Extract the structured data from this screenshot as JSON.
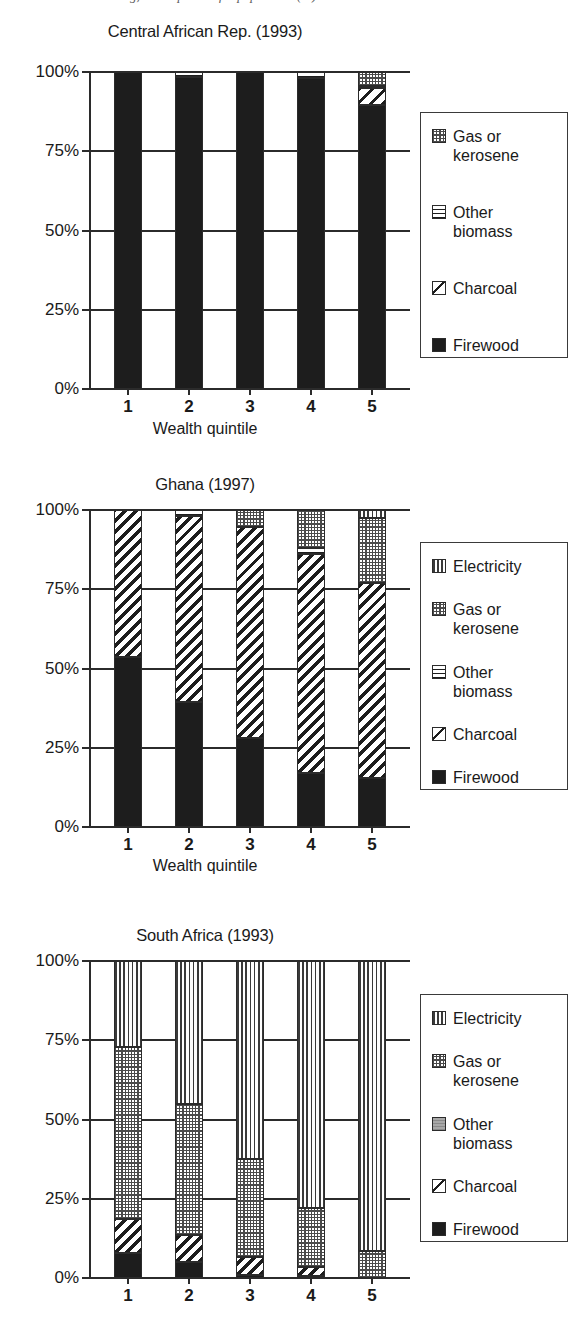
{
  "page": {
    "cut_header_text": "ing, and expanded for population (%)"
  },
  "axis": {
    "y_ticks": [
      "100%",
      "75%",
      "50%",
      "25%",
      "0%"
    ],
    "y_tick_values": [
      100,
      75,
      50,
      25,
      0
    ],
    "x_ticks": [
      "1",
      "2",
      "3",
      "4",
      "5"
    ],
    "x_axis_label": "Wealth quintile"
  },
  "fuels": {
    "firewood": {
      "label": "Firewood",
      "pattern": "solid-black",
      "color": "#1d1d1d"
    },
    "charcoal": {
      "label": "Charcoal",
      "pattern": "diagonal-hatch",
      "color": "#ffffff"
    },
    "other_biomass": {
      "label": "Other\nbiomass",
      "pattern": "horizontal-lines",
      "color": "#ffffff"
    },
    "gas_or_kerosene": {
      "label": "Gas or\nkerosene",
      "pattern": "crosshatch-grid",
      "color": "#cccccc"
    },
    "electricity": {
      "label": "Electricity",
      "pattern": "vertical-lines",
      "color": "#ffffff"
    }
  },
  "charts": [
    {
      "id": "central-african-rep",
      "title": "Central African Rep. (1993)",
      "show_x_axis_label": true,
      "legend": [
        "gas_or_kerosene",
        "other_biomass",
        "charcoal",
        "firewood"
      ],
      "chart_data": {
        "type": "bar",
        "subtype": "stacked-100-percent",
        "title": "Central African Rep. (1993)",
        "xlabel": "Wealth quintile",
        "ylabel": "",
        "ylim": [
          0,
          100
        ],
        "grid": true,
        "legend_position": "right",
        "categories": [
          "1",
          "2",
          "3",
          "4",
          "5"
        ],
        "series": [
          {
            "name": "Firewood",
            "values": [
              100,
              98.5,
              100,
              98.0,
              89.5
            ]
          },
          {
            "name": "Charcoal",
            "values": [
              0,
              0,
              0,
              0,
              5.5
            ]
          },
          {
            "name": "Other biomass",
            "values": [
              0,
              1.5,
              0,
              2.0,
              0.5
            ]
          },
          {
            "name": "Gas or kerosene",
            "values": [
              0,
              0,
              0,
              0,
              4.5
            ]
          },
          {
            "name": "Electricity",
            "values": [
              0,
              0,
              0,
              0,
              0
            ]
          }
        ]
      }
    },
    {
      "id": "ghana",
      "title": "Ghana (1997)",
      "show_x_axis_label": true,
      "legend": [
        "electricity",
        "gas_or_kerosene",
        "other_biomass",
        "charcoal",
        "firewood"
      ],
      "chart_data": {
        "type": "bar",
        "subtype": "stacked-100-percent",
        "title": "Ghana (1997)",
        "xlabel": "Wealth quintile",
        "ylabel": "",
        "ylim": [
          0,
          100
        ],
        "grid": true,
        "legend_position": "right",
        "categories": [
          "1",
          "2",
          "3",
          "4",
          "5"
        ],
        "series": [
          {
            "name": "Firewood",
            "values": [
              53.5,
              39.5,
              28.0,
              17.0,
              15.5
            ]
          },
          {
            "name": "Charcoal",
            "values": [
              46.5,
              58.5,
              66.5,
              69.0,
              61.5
            ]
          },
          {
            "name": "Other biomass",
            "values": [
              0,
              2.0,
              0,
              2.0,
              0
            ]
          },
          {
            "name": "Gas or kerosene",
            "values": [
              0,
              0,
              5.5,
              12.0,
              20.5
            ]
          },
          {
            "name": "Electricity",
            "values": [
              0,
              0,
              0,
              0,
              2.5
            ]
          }
        ]
      }
    },
    {
      "id": "south-africa",
      "title": "South Africa (1993)",
      "show_x_axis_label": false,
      "legend": [
        "electricity",
        "gas_or_kerosene",
        "other_biomass",
        "charcoal",
        "firewood"
      ],
      "chart_data": {
        "type": "bar",
        "subtype": "stacked-100-percent",
        "title": "South Africa (1993)",
        "xlabel": "Wealth quintile",
        "ylabel": "",
        "ylim": [
          0,
          100
        ],
        "grid": true,
        "legend_position": "right",
        "categories": [
          "1",
          "2",
          "3",
          "4",
          "5"
        ],
        "series": [
          {
            "name": "Firewood",
            "values": [
              8.0,
              5.0,
              1.0,
              0.5,
              0
            ]
          },
          {
            "name": "Charcoal",
            "values": [
              10.5,
              8.5,
              5.5,
              3.0,
              0
            ]
          },
          {
            "name": "Other biomass",
            "values": [
              0,
              0,
              0,
              0,
              0
            ]
          },
          {
            "name": "Gas or kerosene",
            "values": [
              54.5,
              41.5,
              31.0,
              18.5,
              8.5
            ]
          },
          {
            "name": "Electricity",
            "values": [
              27.0,
              45.0,
              62.5,
              78.0,
              91.5
            ]
          }
        ]
      }
    }
  ]
}
